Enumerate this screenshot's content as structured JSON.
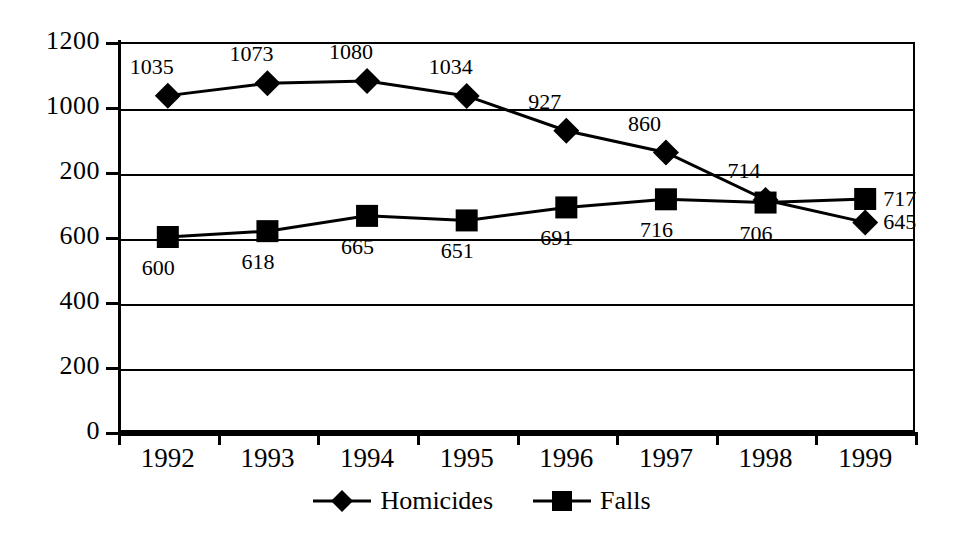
{
  "chart_data": {
    "type": "line",
    "title": "",
    "subtitle": "",
    "xlabel": "",
    "ylabel": "",
    "categories": [
      "1992",
      "1993",
      "1994",
      "1995",
      "1996",
      "1997",
      "1998",
      "1999"
    ],
    "series": [
      {
        "name": "Homicides",
        "marker": "diamond",
        "color": "#000000",
        "values": [
          1035,
          1073,
          1080,
          1034,
          927,
          860,
          714,
          645
        ],
        "label_position": "above"
      },
      {
        "name": "Falls",
        "marker": "square",
        "color": "#000000",
        "values": [
          600,
          618,
          665,
          651,
          691,
          716,
          706,
          717
        ],
        "label_position": "below"
      }
    ],
    "ylim": [
      0,
      1200
    ],
    "ytick_values": [
      0,
      200,
      400,
      600,
      800,
      1000,
      1200
    ],
    "ytick_labels": [
      "0",
      "200",
      "400",
      "600",
      "200",
      "1000",
      "1200"
    ],
    "grid": true,
    "grid_axis": "y",
    "legend_position": "bottom",
    "note": "The fifth y-axis tick is printed as '200' in the source image where '800' is implied by the linear scale."
  },
  "legend": {
    "items": [
      {
        "label": "Homicides",
        "marker": "diamond-marker"
      },
      {
        "label": "Falls",
        "marker": "square-marker"
      }
    ]
  }
}
